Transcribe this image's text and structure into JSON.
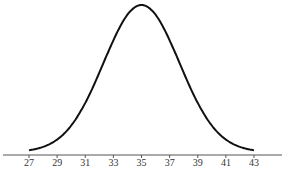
{
  "chart_data": {
    "type": "line",
    "title": "",
    "xlabel": "",
    "ylabel": "",
    "mean": 35,
    "std_dev": 2.7,
    "xlim": [
      27,
      43
    ],
    "x_ticks": [
      27,
      29,
      31,
      33,
      35,
      37,
      39,
      41,
      43
    ],
    "x_tick_labels": [
      "27",
      "29",
      "31",
      "33",
      "35",
      "37",
      "39",
      "41",
      "43"
    ],
    "grid": false,
    "legend": "none",
    "colors": {
      "curve": "#111111",
      "axis": "#555555",
      "text": "#333333"
    }
  }
}
